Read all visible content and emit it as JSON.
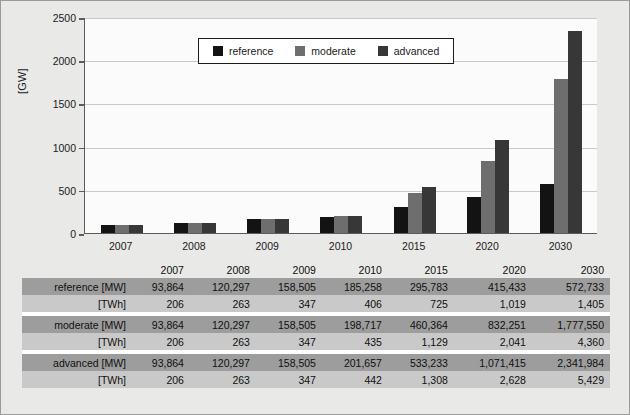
{
  "chart_data": {
    "type": "bar",
    "title": "",
    "xlabel": "",
    "ylabel": "[GW]",
    "categories": [
      "2007",
      "2008",
      "2009",
      "2010",
      "2015",
      "2020",
      "2030"
    ],
    "series": [
      {
        "name": "reference",
        "color": "#131313",
        "values": [
          93.864,
          120.297,
          158.505,
          185.258,
          295.783,
          415.433,
          572.733
        ]
      },
      {
        "name": "moderate",
        "color": "#6e6e6e",
        "values": [
          93.864,
          120.297,
          158.505,
          198.717,
          460.364,
          832.251,
          1777.55
        ]
      },
      {
        "name": "advanced",
        "color": "#373737",
        "values": [
          93.864,
          120.297,
          158.505,
          201.657,
          533.233,
          1071.415,
          2341.984
        ]
      }
    ],
    "ylim": [
      0,
      2500
    ],
    "yticks": [
      0,
      500,
      1000,
      1500,
      2000,
      2500
    ],
    "ytick_labels": [
      "0",
      "500",
      "1000",
      "1500",
      "2000",
      "2500"
    ],
    "grid": true,
    "legend_position": "top-center",
    "legend_entries": [
      "reference",
      "moderate",
      "advanced"
    ]
  },
  "axis": {
    "y_title": "[GW]",
    "y_tick_labels": [
      "2500",
      "2000",
      "1500",
      "1000",
      "500",
      "0"
    ],
    "x_tick_labels": [
      "2007",
      "2008",
      "2009",
      "2010",
      "2015",
      "2020",
      "2030"
    ]
  },
  "legend": {
    "items": [
      {
        "label": "reference",
        "color": "#131313"
      },
      {
        "label": "moderate",
        "color": "#6e6e6e"
      },
      {
        "label": "advanced",
        "color": "#373737"
      }
    ]
  },
  "table": {
    "columns": [
      "2007",
      "2008",
      "2009",
      "2010",
      "2015",
      "2020",
      "2030"
    ],
    "rows": [
      {
        "label": "reference [MW]",
        "unit": "MW",
        "values": [
          "93,864",
          "120,297",
          "158,505",
          "185,258",
          "295,783",
          "415,433",
          "572,733"
        ]
      },
      {
        "label": "[TWh]",
        "unit": "TWh",
        "values": [
          "206",
          "263",
          "347",
          "406",
          "725",
          "1,019",
          "1,405"
        ]
      },
      {
        "label": "moderate [MW]",
        "unit": "MW",
        "values": [
          "93,864",
          "120,297",
          "158,505",
          "198,717",
          "460,364",
          "832,251",
          "1,777,550"
        ]
      },
      {
        "label": "[TWh]",
        "unit": "TWh",
        "values": [
          "206",
          "263",
          "347",
          "435",
          "1,129",
          "2,041",
          "4,360"
        ]
      },
      {
        "label": "advanced [MW]",
        "unit": "MW",
        "values": [
          "93,864",
          "120,297",
          "158,505",
          "201,657",
          "533,233",
          "1,071,415",
          "2,341,984"
        ]
      },
      {
        "label": "[TWh]",
        "unit": "TWh",
        "values": [
          "206",
          "263",
          "347",
          "442",
          "1,308",
          "2,628",
          "5,429"
        ]
      }
    ]
  },
  "colors": {
    "figure_background": "#e9e9e7",
    "plot_background": "#fbfbfb",
    "gridline": "#c9c9c9",
    "axis": "#5b5b5b",
    "row_mw": "#9d9d9d",
    "row_twh": "#c9c9c9"
  }
}
